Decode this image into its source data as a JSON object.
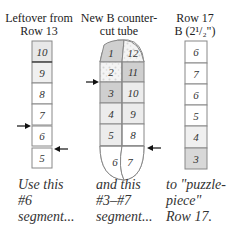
{
  "columns": [
    {
      "title_line1": "Leftover from",
      "title_line2": "Row 13",
      "segments": [
        "10",
        "9",
        "8",
        "7",
        "6",
        "5"
      ],
      "caption": [
        "Use this",
        "#6",
        "segment..."
      ]
    },
    {
      "title_line1": "New B counter-",
      "title_line2": "cut tube",
      "left_segments": [
        "1",
        "2",
        "3",
        "4",
        "5",
        "6"
      ],
      "right_segments": [
        "12",
        "11",
        "10",
        "9",
        "8",
        "7"
      ],
      "caption": [
        "and this",
        "#3–#7",
        "segment..."
      ]
    },
    {
      "title_line1": "Row 17",
      "title_line2": "B (2¹/₂\")",
      "segments": [
        "6",
        "7",
        "6",
        "5",
        "4",
        "3"
      ],
      "caption": [
        "to \"puzzle-",
        "piece\"",
        "Row 17."
      ]
    }
  ],
  "colors": {
    "outline": "#888888",
    "dark_fill": "#cfcfcf",
    "light_fill": "#ececec",
    "white_fill": "#ffffff",
    "arrow": "#111111"
  }
}
